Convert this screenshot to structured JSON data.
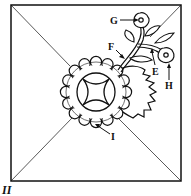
{
  "figure": {
    "label": "II",
    "colors": {
      "line": "#111111",
      "background": "#ffffff"
    }
  },
  "callouts": [
    {
      "id": "G",
      "label": "G",
      "target": "top-flower"
    },
    {
      "id": "F",
      "label": "F",
      "target": "stem"
    },
    {
      "id": "E",
      "label": "E",
      "target": "branch-stem"
    },
    {
      "id": "H",
      "label": "H",
      "target": "side-flower"
    },
    {
      "id": "I",
      "label": "I",
      "target": "scalloped-border"
    }
  ]
}
